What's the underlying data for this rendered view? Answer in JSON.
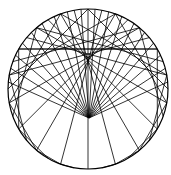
{
  "figure": {
    "circle": {
      "cx": 88,
      "cy": 89,
      "r": 80
    },
    "focus": {
      "x": 89,
      "y": 118
    },
    "spoke_count": 18,
    "chord_count": 36,
    "stroke_color": "#000000",
    "background_color": "#ffffff"
  }
}
